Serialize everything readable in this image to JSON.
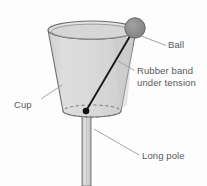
{
  "diagram": {
    "type": "labeled-illustration",
    "canvas": {
      "width": 207,
      "height": 186
    },
    "background_color": "#fdfdfd"
  },
  "labels": {
    "ball": "Ball",
    "rubber_band_line1": "Rubber band",
    "rubber_band_line2": "under tension",
    "cup": "Cup",
    "long_pole": "Long pole"
  },
  "parts": {
    "cup": {
      "name": "cup",
      "fill_color": "#d9d9d9",
      "stroke_color": "#6e6e70",
      "rim_center": [
        92,
        30
      ],
      "rim_radius_x": 44,
      "rim_radius_y": 9,
      "base_center": [
        92,
        111
      ],
      "base_radius_x": 29,
      "base_radius_y": 6,
      "base_line_style": "dashed"
    },
    "ball": {
      "name": "ball",
      "fill_color": "#8a8a8a",
      "stroke_color": "#5a5a5c",
      "center": [
        135,
        28
      ],
      "radius": 10
    },
    "rubber_band": {
      "name": "rubber-band-under-tension",
      "stroke_color": "#1a1a1a",
      "from": [
        86,
        111
      ],
      "to": [
        132,
        31
      ],
      "anchor_dot_radius": 3.2
    },
    "long_pole": {
      "name": "long-pole",
      "fill_color": "#d0d0d0",
      "stroke_color": "#6e6e70",
      "x_left": 82,
      "x_right": 91,
      "y_top": 108,
      "y_bottom": 186
    }
  },
  "leader_lines": {
    "ball": {
      "from": [
        140,
        36
      ],
      "to": [
        166,
        45
      ]
    },
    "rubber_band": {
      "from": [
        119,
        62
      ],
      "to": [
        134,
        70
      ]
    },
    "cup": {
      "from": [
        62,
        86
      ],
      "to": [
        41,
        98
      ]
    },
    "long_pole": {
      "from": [
        95,
        130
      ],
      "to": [
        139,
        155
      ]
    },
    "stroke_color": "#9b9b9d"
  },
  "label_positions": {
    "ball": [
      168,
      48
    ],
    "rubber_band_line1": [
      137,
      74
    ],
    "rubber_band_line2": [
      137,
      86
    ],
    "cup": [
      14,
      108
    ],
    "long_pole": [
      142,
      159
    ]
  },
  "colors": {
    "text": "#58585a",
    "outline": "#6e6e70",
    "leader": "#9b9b9d",
    "cup_fill": "#d9d9d9",
    "ball_fill": "#8a8a8a",
    "band": "#1a1a1a"
  }
}
